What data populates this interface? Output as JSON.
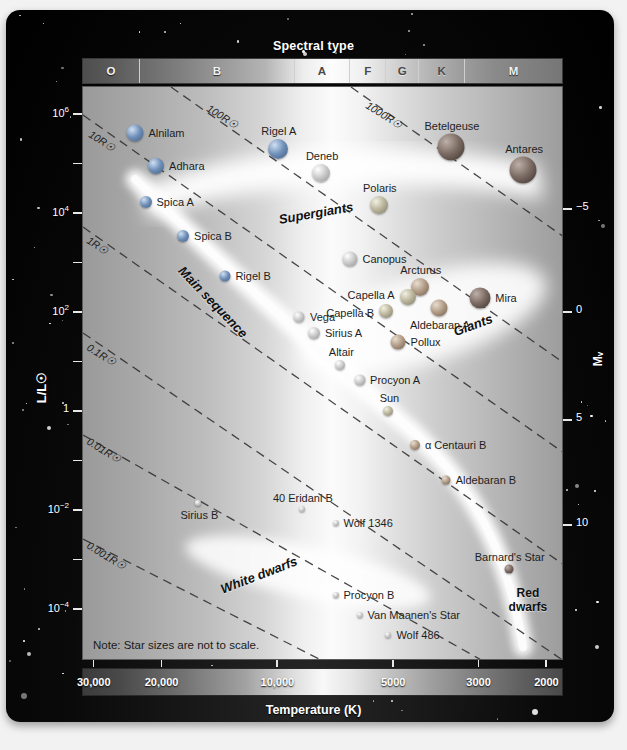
{
  "figure": {
    "spectral_title": "Spectral type",
    "temperature_title": "Temperature (K)",
    "luminosity_label": "L/L☉",
    "magnitude_label": "Mᵥ",
    "note": "Note: Star sizes are not to scale."
  },
  "chart_data": {
    "type": "scatter",
    "xlabel": "Temperature (K)",
    "ylabel": "L/L☉",
    "y2label": "Mᵥ",
    "grid": false,
    "legend": "none",
    "xlim": [
      32000,
      1800
    ],
    "ylim": [
      1e-05,
      3000000.0
    ],
    "x_ticks": [
      "30,000",
      "20,000",
      "10,000",
      "5000",
      "3000",
      "2000"
    ],
    "x_tick_values": [
      30000,
      20000,
      10000,
      5000,
      3000,
      2000
    ],
    "y_ticks": [
      "10⁶",
      "10⁴",
      "10²",
      "1",
      "10⁻²",
      "10⁻⁴"
    ],
    "y_tick_values": [
      1000000,
      10000,
      100,
      1,
      0.01,
      0.0001
    ],
    "y2_ticks": [
      "−5",
      "0",
      "5",
      "10"
    ],
    "y2_tick_values": [
      -5,
      0,
      5,
      10
    ],
    "spectral_classes": [
      {
        "label": "O",
        "width_pct": 11.9,
        "dark_text": false
      },
      {
        "label": "B",
        "width_pct": 32.3,
        "dark_text": false
      },
      {
        "label": "A",
        "width_pct": 11.6,
        "dark_text": true
      },
      {
        "label": "F",
        "width_pct": 7.5,
        "dark_text": true
      },
      {
        "label": "G",
        "width_pct": 6.9,
        "dark_text": true
      },
      {
        "label": "K",
        "width_pct": 9.6,
        "dark_text": true
      },
      {
        "label": "M",
        "width_pct": 20.2,
        "dark_text": false
      }
    ],
    "regions": [
      {
        "name": "Supergiants",
        "x_pct": 48.5,
        "y_pct": 22.0,
        "rotate": -10,
        "size": 13
      },
      {
        "name": "Giants",
        "x_pct": 81.0,
        "y_pct": 41.5,
        "rotate": -20,
        "size": 13
      },
      {
        "name": "Main sequence",
        "x_pct": 27.0,
        "y_pct": 37.5,
        "rotate": 46,
        "size": 13
      },
      {
        "name": "White dwarfs",
        "x_pct": 36.5,
        "y_pct": 85.0,
        "rotate": -21,
        "size": 13
      },
      {
        "name": "Red dwarfs",
        "x_pct": 92.5,
        "y_pct": 89.5,
        "rotate": 0,
        "size": 12
      }
    ],
    "radius_lines": [
      {
        "label": "1000R☉",
        "lx_pct": 59.0,
        "ly_pct": 2.0
      },
      {
        "label": "100R☉",
        "lx_pct": 26.0,
        "ly_pct": 2.5
      },
      {
        "label": "10R☉",
        "lx_pct": 1.5,
        "ly_pct": 7.0
      },
      {
        "label": "1R☉",
        "lx_pct": 1.0,
        "ly_pct": 25.5
      },
      {
        "label": "0.1R☉",
        "lx_pct": 1.0,
        "ly_pct": 44.0
      },
      {
        "label": "0.01R☉",
        "lx_pct": 1.0,
        "ly_pct": 60.5
      },
      {
        "label": "0.001R☉",
        "lx_pct": 1.0,
        "ly_pct": 78.5
      }
    ],
    "points": [
      {
        "name": "Alnilam",
        "x_pct": 10.8,
        "y_pct": 8.0,
        "r": 8.5,
        "shade": "blue",
        "label_side": "right"
      },
      {
        "name": "Adhara",
        "x_pct": 15.2,
        "y_pct": 13.8,
        "r": 8.0,
        "shade": "blue",
        "label_side": "right"
      },
      {
        "name": "Spica A",
        "x_pct": 13.0,
        "y_pct": 20.0,
        "r": 6.0,
        "shade": "blue",
        "label_side": "right"
      },
      {
        "name": "Spica B",
        "x_pct": 20.8,
        "y_pct": 26.0,
        "r": 6.0,
        "shade": "blue",
        "label_side": "right"
      },
      {
        "name": "Rigel A",
        "x_pct": 40.5,
        "y_pct": 10.8,
        "r": 10.0,
        "shade": "blue",
        "label_side": "above"
      },
      {
        "name": "Deneb",
        "x_pct": 49.5,
        "y_pct": 15.0,
        "r": 9.0,
        "shade": "white",
        "label_side": "above"
      },
      {
        "name": "Polaris",
        "x_pct": 61.5,
        "y_pct": 20.5,
        "r": 9.0,
        "shade": "yellow",
        "label_side": "above"
      },
      {
        "name": "Betelgeuse",
        "x_pct": 76.5,
        "y_pct": 10.5,
        "r": 13.5,
        "shade": "red",
        "label_side": "above"
      },
      {
        "name": "Antares",
        "x_pct": 91.5,
        "y_pct": 14.5,
        "r": 13.5,
        "shade": "red",
        "label_side": "above"
      },
      {
        "name": "Canopus",
        "x_pct": 55.5,
        "y_pct": 30.0,
        "r": 7.5,
        "shade": "white",
        "label_side": "right"
      },
      {
        "name": "Arcturus",
        "x_pct": 70.0,
        "y_pct": 34.8,
        "r": 9.0,
        "shade": "orange",
        "label_side": "above"
      },
      {
        "name": "Mira",
        "x_pct": 82.5,
        "y_pct": 36.8,
        "r": 10.5,
        "shade": "red",
        "label_side": "right"
      },
      {
        "name": "Capella A",
        "x_pct": 67.5,
        "y_pct": 36.5,
        "r": 8.0,
        "shade": "yellow",
        "label_side": "leftup"
      },
      {
        "name": "Capella B",
        "x_pct": 63.0,
        "y_pct": 39.0,
        "r": 7.0,
        "shade": "yellow",
        "label_side": "left"
      },
      {
        "name": "Aldebaran A",
        "x_pct": 74.0,
        "y_pct": 38.5,
        "r": 8.5,
        "shade": "orange",
        "label_side": "below"
      },
      {
        "name": "Pollux",
        "x_pct": 65.5,
        "y_pct": 44.5,
        "r": 7.5,
        "shade": "orange",
        "label_side": "right"
      },
      {
        "name": "Rigel B",
        "x_pct": 29.5,
        "y_pct": 33.0,
        "r": 5.5,
        "shade": "blue",
        "label_side": "right"
      },
      {
        "name": "Vega",
        "x_pct": 45.0,
        "y_pct": 40.0,
        "r": 5.5,
        "shade": "white",
        "label_side": "right"
      },
      {
        "name": "Sirius A",
        "x_pct": 48.0,
        "y_pct": 42.8,
        "r": 6.0,
        "shade": "white",
        "label_side": "right"
      },
      {
        "name": "Altair",
        "x_pct": 53.5,
        "y_pct": 48.5,
        "r": 5.0,
        "shade": "white",
        "label_side": "above"
      },
      {
        "name": "Procyon A",
        "x_pct": 57.5,
        "y_pct": 51.0,
        "r": 5.5,
        "shade": "white",
        "label_side": "right"
      },
      {
        "name": "Sun",
        "x_pct": 63.5,
        "y_pct": 56.5,
        "r": 5.0,
        "shade": "yellow",
        "label_side": "above"
      },
      {
        "name": "α Centauri B",
        "x_pct": 69.0,
        "y_pct": 62.3,
        "r": 5.0,
        "shade": "orange",
        "label_side": "right"
      },
      {
        "name": "Aldebaran B",
        "x_pct": 75.5,
        "y_pct": 68.5,
        "r": 4.5,
        "shade": "orange",
        "label_side": "right"
      },
      {
        "name": "Barnard's Star",
        "x_pct": 88.5,
        "y_pct": 84.0,
        "r": 4.5,
        "shade": "red",
        "label_side": "above"
      },
      {
        "name": "Sirius B",
        "x_pct": 24.0,
        "y_pct": 72.5,
        "r": 3.0,
        "shade": "white",
        "label_side": "below"
      },
      {
        "name": "40 Eridani B",
        "x_pct": 45.5,
        "y_pct": 73.5,
        "r": 3.0,
        "shade": "white",
        "label_side": "above"
      },
      {
        "name": "Wolf 1346",
        "x_pct": 52.5,
        "y_pct": 76.0,
        "r": 3.0,
        "shade": "white",
        "label_side": "right"
      },
      {
        "name": "Procyon B",
        "x_pct": 52.5,
        "y_pct": 88.5,
        "r": 3.0,
        "shade": "white",
        "label_side": "right"
      },
      {
        "name": "Van Maanen's Star",
        "x_pct": 57.5,
        "y_pct": 92.0,
        "r": 3.0,
        "shade": "white",
        "label_side": "right"
      },
      {
        "name": "Wolf 486",
        "x_pct": 63.5,
        "y_pct": 95.5,
        "r": 3.0,
        "shade": "white",
        "label_side": "right"
      }
    ]
  }
}
